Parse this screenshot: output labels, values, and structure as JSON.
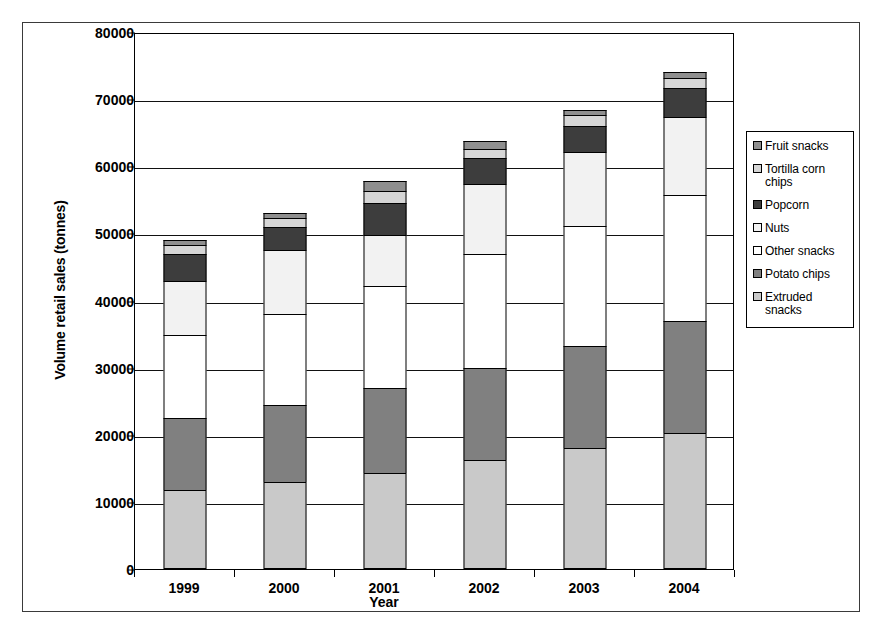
{
  "figure": {
    "y_axis_title": "Volume retail sales (tonnes)",
    "x_axis_title": "Year"
  },
  "chart_data": {
    "type": "bar",
    "stacked": true,
    "title": "",
    "xlabel": "Year",
    "ylabel": "Volume retail sales (tonnes)",
    "categories": [
      "1999",
      "2000",
      "2001",
      "2002",
      "2003",
      "2004"
    ],
    "ylim": [
      0,
      80000
    ],
    "yticks": [
      "0",
      "10000",
      "20000",
      "30000",
      "40000",
      "50000",
      "60000",
      "70000",
      "80000"
    ],
    "ytick_values": [
      0,
      10000,
      20000,
      30000,
      40000,
      50000,
      60000,
      70000,
      80000
    ],
    "grid": true,
    "legend_position": "right",
    "series": [
      {
        "name": "Extruded snacks",
        "color": "#c9c9c9",
        "values": [
          11700,
          13000,
          14300,
          16200,
          18000,
          20200
        ]
      },
      {
        "name": "Potato chips",
        "color": "#808080",
        "values": [
          10800,
          11500,
          12700,
          13700,
          15200,
          16800
        ]
      },
      {
        "name": "Other snacks",
        "color": "#ffffff",
        "values": [
          12400,
          13500,
          15200,
          17000,
          17900,
          18700
        ]
      },
      {
        "name": "Nuts",
        "color": "#f2f2f2",
        "values": [
          8000,
          9500,
          7500,
          10500,
          11100,
          11600
        ]
      },
      {
        "name": "Popcorn",
        "color": "#3d3d3d",
        "values": [
          4000,
          3500,
          4800,
          3900,
          3800,
          4300
        ]
      },
      {
        "name": "Tortilla corn chips",
        "color": "#d6d6d6",
        "values": [
          1400,
          1300,
          1800,
          1300,
          1600,
          1500
        ]
      },
      {
        "name": "Fruit snacks",
        "color": "#8f8f8f",
        "values": [
          700,
          700,
          1500,
          1100,
          800,
          900
        ]
      }
    ],
    "totals": [
      48500,
      53000,
      57800,
      63700,
      68400,
      74000
    ],
    "legend_order_top_to_bottom": [
      "Fruit snacks",
      "Tortilla corn chips",
      "Popcorn",
      "Nuts",
      "Other snacks",
      "Potato chips",
      "Extruded snacks"
    ]
  }
}
